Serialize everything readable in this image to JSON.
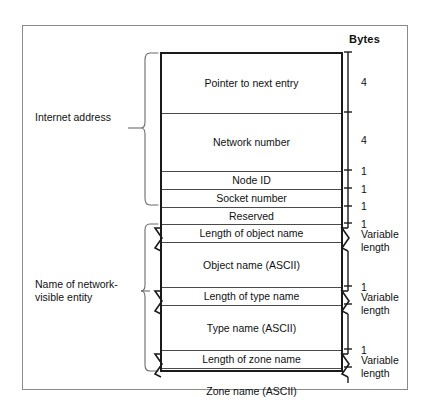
{
  "figure": {
    "bytes_header": "Bytes",
    "group_labels": [
      {
        "id": "internet-address",
        "text_line1": "Internet address",
        "text_line2": ""
      },
      {
        "id": "nbp-entity-name",
        "text_line1": "Name of network-",
        "text_line2": "visible entity"
      }
    ],
    "fields": [
      {
        "name": "Pointer to next entry",
        "bytes_line1": "4",
        "bytes_line2": "",
        "variable": false
      },
      {
        "name": "Network number",
        "bytes_line1": "4",
        "bytes_line2": "",
        "variable": false
      },
      {
        "name": "Node ID",
        "bytes_line1": "1",
        "bytes_line2": "",
        "variable": false
      },
      {
        "name": "Socket number",
        "bytes_line1": "1",
        "bytes_line2": "",
        "variable": false
      },
      {
        "name": "Reserved",
        "bytes_line1": "1",
        "bytes_line2": "",
        "variable": false
      },
      {
        "name": "Length of object name",
        "bytes_line1": "1",
        "bytes_line2": "",
        "variable": false
      },
      {
        "name": "Object name (ASCII)",
        "bytes_line1": "Variable",
        "bytes_line2": "length",
        "variable": true
      },
      {
        "name": "Length of type name",
        "bytes_line1": "1",
        "bytes_line2": "",
        "variable": false
      },
      {
        "name": "Type name (ASCII)",
        "bytes_line1": "Variable",
        "bytes_line2": "length",
        "variable": true
      },
      {
        "name": "Length of zone name",
        "bytes_line1": "1",
        "bytes_line2": "",
        "variable": false
      },
      {
        "name": "Zone name (ASCII)",
        "bytes_line1": "Variable",
        "bytes_line2": "length",
        "variable": true
      }
    ],
    "colors": {
      "frame_border": "#8a8a8a",
      "table_border": "#1a1a1a",
      "row_divider": "#4a4a4a",
      "text": "#111111",
      "background": "#ffffff"
    }
  }
}
